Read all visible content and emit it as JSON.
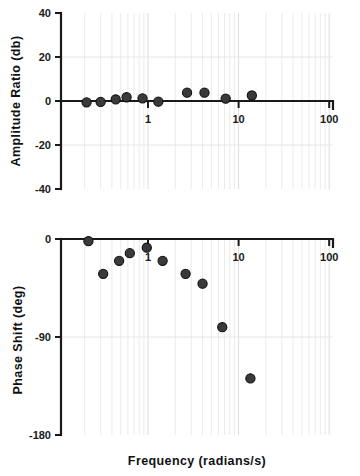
{
  "figure": {
    "background_color": "#ffffff",
    "marker_color": "#3a3a3a",
    "axis_color": "#1a1a1a",
    "grid_color": "#e0e0e0"
  },
  "xaxis": {
    "label": "Frequency   (radians/s)",
    "scale": "log",
    "range": [
      0.105,
      100
    ],
    "tick_labels": [
      "1",
      "10",
      "100"
    ],
    "tick_values": [
      1,
      10,
      100
    ]
  },
  "charts": {
    "amplitude": {
      "ylabel": "Amplitude Ratio (db)",
      "ytick_labels": [
        "40",
        "20",
        "0",
        "-20",
        "-40"
      ],
      "ytick_values": [
        40,
        20,
        0,
        -20,
        -40
      ]
    },
    "phase": {
      "ylabel": "Phase Shift (deg)",
      "ytick_labels": [
        "0",
        "-90",
        "-180"
      ],
      "ytick_values": [
        0,
        -90,
        -180
      ]
    }
  },
  "chart_data": [
    {
      "type": "scatter",
      "title": "",
      "xlabel": "Frequency   (radians/s)",
      "ylabel": "Amplitude Ratio (db)",
      "xscale": "log",
      "xlim": [
        0.105,
        100
      ],
      "ylim": [
        -40,
        40
      ],
      "grid": true,
      "legend": "none",
      "series": [
        {
          "name": "Amplitude Ratio",
          "marker": "filled-circle",
          "color": "#3a3a3a",
          "points": [
            {
              "x": 0.21,
              "y": -0.6
            },
            {
              "x": 0.3,
              "y": -0.4
            },
            {
              "x": 0.44,
              "y": 0.7
            },
            {
              "x": 0.58,
              "y": 1.7
            },
            {
              "x": 0.87,
              "y": 1.2
            },
            {
              "x": 1.3,
              "y": -0.3
            },
            {
              "x": 2.7,
              "y": 3.8
            },
            {
              "x": 4.2,
              "y": 3.8
            },
            {
              "x": 7.2,
              "y": 1.1
            },
            {
              "x": 14.0,
              "y": 2.5
            }
          ]
        }
      ]
    },
    {
      "type": "scatter",
      "title": "",
      "xlabel": "Frequency   (radians/s)",
      "ylabel": "Phase Shift (deg)",
      "xscale": "log",
      "xlim": [
        0.105,
        100
      ],
      "ylim": [
        -180,
        0
      ],
      "grid": true,
      "legend": "none",
      "series": [
        {
          "name": "Phase Shift",
          "marker": "filled-circle",
          "color": "#3a3a3a",
          "points": [
            {
              "x": 0.22,
              "y": -2
            },
            {
              "x": 0.32,
              "y": -32
            },
            {
              "x": 0.48,
              "y": -20
            },
            {
              "x": 0.63,
              "y": -13
            },
            {
              "x": 0.97,
              "y": -8
            },
            {
              "x": 1.45,
              "y": -20
            },
            {
              "x": 2.6,
              "y": -32
            },
            {
              "x": 4.0,
              "y": -41
            },
            {
              "x": 6.6,
              "y": -81
            },
            {
              "x": 13.5,
              "y": -128
            }
          ]
        }
      ]
    }
  ]
}
